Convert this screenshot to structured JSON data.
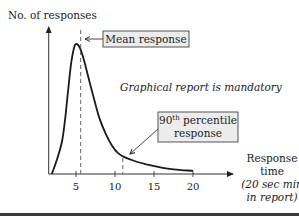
{
  "chart_data": {
    "type": "line",
    "title": "",
    "ylabel": "No. of responses",
    "xlabel": [
      "Response",
      "time"
    ],
    "xlabel_note": [
      "(20 sec min",
      "in report)"
    ],
    "x_ticks": [
      5,
      10,
      15,
      20
    ],
    "x_tick_labels": [
      "5",
      "10",
      "15",
      "20"
    ],
    "xlim": [
      1.5,
      25
    ],
    "ylim": [
      0,
      1
    ],
    "grid": false,
    "series": [
      {
        "name": "Response time distribution",
        "x": [
          1.9,
          2.6,
          3.2,
          3.6,
          4.0,
          4.4,
          4.8,
          5.1,
          5.5,
          6.0,
          6.6,
          7.3,
          8.0,
          8.8,
          9.6,
          10.4,
          11.2,
          12.5,
          14.0,
          15.5,
          17.0,
          18.5,
          20.0
        ],
        "y": [
          0.0,
          0.12,
          0.25,
          0.42,
          0.65,
          0.86,
          0.98,
          1.0,
          0.97,
          0.88,
          0.74,
          0.58,
          0.43,
          0.31,
          0.22,
          0.16,
          0.13,
          0.1,
          0.075,
          0.055,
          0.04,
          0.03,
          0.025
        ]
      }
    ],
    "markers": [
      {
        "name": "mean",
        "x": 5.6,
        "label": "Mean response"
      },
      {
        "name": "p90",
        "x": 11.0,
        "label_main": "90",
        "label_sup": "th",
        "label_rest": " percentile",
        "label_line2": "response"
      }
    ],
    "annotations": [
      "Graphical report is mandatory"
    ]
  },
  "colors": {
    "curve": "#1a1a1a",
    "axis": "#333333",
    "box_fill": "#ececec",
    "box_stroke": "#444444",
    "bottom_rule": "#3a3a3a"
  }
}
